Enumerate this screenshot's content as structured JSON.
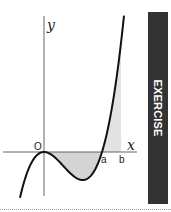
{
  "graph": {
    "axis_labels": {
      "x": "x",
      "y": "y",
      "origin": "O"
    },
    "point_labels": {
      "a": "a",
      "b": "b"
    },
    "function": "y = k x^2 (x - a)",
    "root_a": 1.0,
    "bound_b": 1.33,
    "shaded_interval": [
      "0",
      "b"
    ],
    "colors": {
      "curve": "#111111",
      "axis": "#555555",
      "shade": "#d4d4d4"
    }
  },
  "sidebar": {
    "label": "EXERCISE",
    "color": "#333333"
  }
}
